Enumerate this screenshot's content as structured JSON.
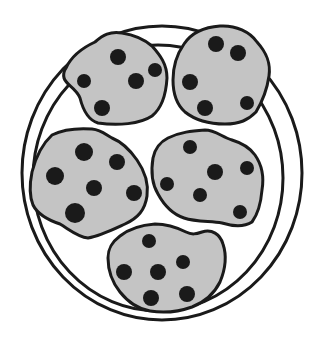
{
  "colors": {
    "background": "#ffffff",
    "outline": "#1a1a1a",
    "cookie_fill": "#c4c4c4",
    "chip": "#1a1a1a"
  },
  "plate": {
    "outer": {
      "cx": 162,
      "cy": 173,
      "rx": 140,
      "ry": 147
    },
    "inner": {
      "cx": 158,
      "cy": 178,
      "rx": 125,
      "ry": 133
    }
  },
  "cookies": [
    {
      "name": "cookie-top-left",
      "path": "M66,68 C72,55 82,48 95,42 C103,35 110,31 122,33 C135,35 145,40 152,46 C160,55 167,64 167,78 C166,95 162,108 152,116 C140,124 118,126 98,123 C88,120 83,110 80,98 C76,88 66,85 64,78 C63,74 64,71 66,68 Z",
      "chips": [
        {
          "cx": 118,
          "cy": 57,
          "r": 8
        },
        {
          "cx": 84,
          "cy": 81,
          "r": 7
        },
        {
          "cx": 136,
          "cy": 81,
          "r": 8
        },
        {
          "cx": 155,
          "cy": 70,
          "r": 7
        },
        {
          "cx": 102,
          "cy": 108,
          "r": 8
        }
      ]
    },
    {
      "name": "cookie-top-right",
      "path": "M184,44 C192,32 205,27 220,26 C236,25 250,32 257,42 C266,52 271,62 269,76 C267,90 262,102 256,112 C248,120 240,124 225,124 C210,124 195,120 185,112 C176,104 173,92 173,80 C173,66 177,54 184,44 Z",
      "chips": [
        {
          "cx": 216,
          "cy": 44,
          "r": 8
        },
        {
          "cx": 238,
          "cy": 53,
          "r": 8
        },
        {
          "cx": 190,
          "cy": 82,
          "r": 8
        },
        {
          "cx": 205,
          "cy": 108,
          "r": 8
        },
        {
          "cx": 247,
          "cy": 103,
          "r": 7
        }
      ]
    },
    {
      "name": "cookie-mid-left",
      "path": "M52,135 C62,130 78,128 92,129 C102,130 106,135 112,138 C122,142 130,150 137,160 C144,170 149,182 147,196 C145,210 138,218 125,224 C112,230 100,236 88,238 C78,237 70,230 60,224 C48,220 38,215 33,205 C29,195 30,182 32,172 C35,160 40,146 52,135 Z",
      "chips": [
        {
          "cx": 84,
          "cy": 152,
          "r": 9
        },
        {
          "cx": 117,
          "cy": 162,
          "r": 8
        },
        {
          "cx": 55,
          "cy": 176,
          "r": 9
        },
        {
          "cx": 94,
          "cy": 188,
          "r": 8
        },
        {
          "cx": 134,
          "cy": 193,
          "r": 8
        },
        {
          "cx": 75,
          "cy": 213,
          "r": 10
        }
      ]
    },
    {
      "name": "cookie-mid-right",
      "path": "M168,138 C180,132 192,131 205,130 C215,130 222,137 232,140 C242,143 250,148 255,155 C262,165 264,178 262,190 C261,202 258,214 252,222 C244,227 232,226 222,223 C210,221 196,222 184,218 C172,214 164,205 158,194 C152,184 151,170 153,158 C155,148 160,142 168,138 Z",
      "chips": [
        {
          "cx": 190,
          "cy": 147,
          "r": 7
        },
        {
          "cx": 215,
          "cy": 172,
          "r": 8
        },
        {
          "cx": 247,
          "cy": 168,
          "r": 7
        },
        {
          "cx": 167,
          "cy": 184,
          "r": 7
        },
        {
          "cx": 200,
          "cy": 195,
          "r": 7
        },
        {
          "cx": 240,
          "cy": 212,
          "r": 7
        }
      ]
    },
    {
      "name": "cookie-bottom",
      "path": "M120,236 C130,228 142,225 155,224 C168,224 178,228 186,232 C192,235 196,234 202,232 C212,229 220,234 223,244 C227,256 225,270 220,282 C214,294 205,302 192,307 C178,312 162,313 150,311 C138,309 128,302 120,292 C112,282 108,270 108,258 C108,248 112,242 120,236 Z",
      "chips": [
        {
          "cx": 149,
          "cy": 241,
          "r": 7
        },
        {
          "cx": 124,
          "cy": 272,
          "r": 8
        },
        {
          "cx": 158,
          "cy": 272,
          "r": 8
        },
        {
          "cx": 183,
          "cy": 262,
          "r": 7
        },
        {
          "cx": 151,
          "cy": 298,
          "r": 8
        },
        {
          "cx": 187,
          "cy": 294,
          "r": 8
        }
      ]
    }
  ]
}
